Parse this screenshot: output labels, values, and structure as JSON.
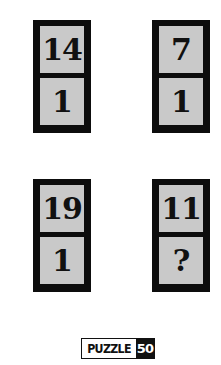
{
  "puzzle": {
    "tiles": [
      {
        "top": "14",
        "bottom": "1"
      },
      {
        "top": "7",
        "bottom": "1"
      },
      {
        "top": "19",
        "bottom": "1"
      },
      {
        "top": "11",
        "bottom": "?"
      }
    ]
  },
  "logo": {
    "word": "PUZZLE",
    "number": "50"
  },
  "colors": {
    "tile_border": "#0d0d0d",
    "cell_fill": "#c9c9c9",
    "background": "#ffffff"
  }
}
